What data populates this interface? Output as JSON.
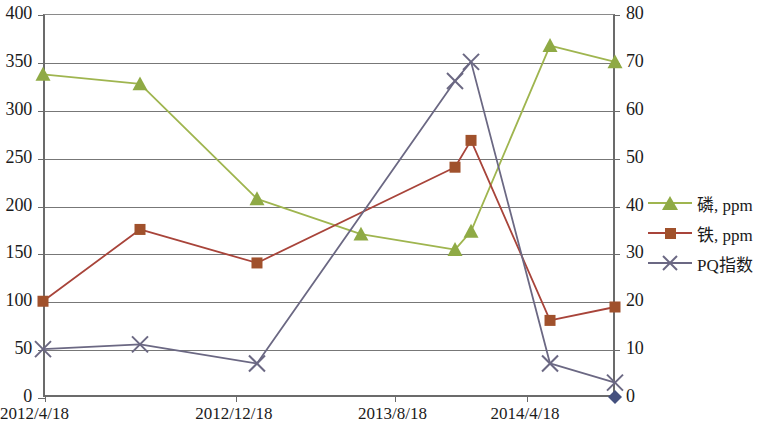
{
  "chart_data": {
    "type": "line",
    "title": "",
    "xlabel": "",
    "ylabel": "",
    "grid": true,
    "legend_position": "right",
    "x_tick_labels": [
      "2012/4/18",
      "2012/12/18",
      "2013/8/18",
      "2014/4/18"
    ],
    "x_tick_positions": [
      0,
      0.3333,
      0.6111,
      0.8426
    ],
    "axes": {
      "left": {
        "min": 0,
        "max": 400,
        "step": 50,
        "ticks": [
          "0",
          "50",
          "100",
          "150",
          "200",
          "250",
          "300",
          "350",
          "400"
        ]
      },
      "right": {
        "min": 0,
        "max": 80,
        "step": 10,
        "ticks": [
          "0",
          "10",
          "20",
          "30",
          "40",
          "50",
          "60",
          "70",
          "80"
        ]
      }
    },
    "series": [
      {
        "name": "磷, ppm",
        "axis": "left",
        "color": "#9fb54f",
        "marker": "triangle",
        "marker_color": "#8faa45",
        "x": [
          0.0,
          0.1696,
          0.3741,
          0.5559,
          0.7203,
          0.7483,
          0.8864,
          1.0
        ],
        "values": [
          337,
          327,
          207,
          170,
          154,
          173,
          367,
          350
        ]
      },
      {
        "name": "铁, ppm",
        "axis": "left",
        "color": "#a8443a",
        "marker": "square",
        "marker_color": "#a0512c",
        "x": [
          0.0,
          0.1696,
          0.3741,
          0.7203,
          0.7483,
          0.8864,
          1.0
        ],
        "values": [
          100,
          175,
          140,
          240,
          268,
          80,
          94
        ]
      },
      {
        "name": "PQ指数",
        "axis": "right",
        "color": "#6b6883",
        "marker": "cross",
        "marker_color": "#6b6883",
        "x": [
          0.0,
          0.1696,
          0.3741,
          0.7203,
          0.7483,
          0.8864,
          1.0
        ],
        "values": [
          10,
          11,
          7,
          66,
          70,
          7,
          3
        ]
      }
    ],
    "end_marker": {
      "shape": "diamond",
      "color": "#44507e",
      "x": 1.0,
      "value": 0,
      "axis": "right"
    }
  },
  "legend": {
    "items": [
      {
        "label": "磷, ppm",
        "color": "#9fb54f",
        "marker": "triangle"
      },
      {
        "label": "铁, ppm",
        "color": "#a8443a",
        "marker": "square"
      },
      {
        "label": "PQ指数",
        "color": "#6b6883",
        "marker": "cross"
      }
    ]
  }
}
